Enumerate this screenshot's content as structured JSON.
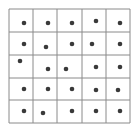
{
  "diagram": {
    "type": "dot-grid",
    "rows": 5,
    "cols": 5,
    "line_color": "#8a8a8a",
    "dot_color": "#3a3a3a",
    "grid_box": {
      "x": 9,
      "y": 9,
      "w": 121,
      "h": 114
    },
    "col_lines": [
      9,
      33,
      57,
      82,
      106,
      130
    ],
    "row_lines": [
      9,
      32,
      55,
      78,
      100,
      123
    ],
    "dots": [
      [
        24,
        23
      ],
      [
        48,
        23
      ],
      [
        72,
        23
      ],
      [
        96,
        21
      ],
      [
        120,
        23
      ],
      [
        24,
        44
      ],
      [
        46,
        47
      ],
      [
        72,
        44
      ],
      [
        92,
        44
      ],
      [
        120,
        44
      ],
      [
        20,
        61
      ],
      [
        48,
        69
      ],
      [
        66,
        69
      ],
      [
        96,
        67
      ],
      [
        120,
        67
      ],
      [
        24,
        89
      ],
      [
        48,
        89
      ],
      [
        72,
        89
      ],
      [
        96,
        90
      ],
      [
        118,
        90
      ],
      [
        24,
        111
      ],
      [
        43,
        113
      ],
      [
        72,
        111
      ],
      [
        96,
        111
      ],
      [
        120,
        111
      ]
    ]
  }
}
